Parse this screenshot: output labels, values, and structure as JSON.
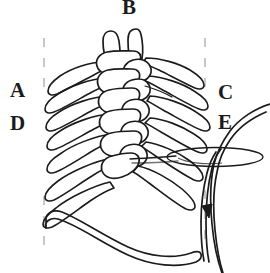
{
  "figure": {
    "type": "line-drawing",
    "background_color": "#ffffff",
    "ink_color": "#1b1b1b",
    "width": 270,
    "height": 273,
    "labels": [
      {
        "id": "A",
        "text": "A",
        "position": "left-upper"
      },
      {
        "id": "B",
        "text": "B",
        "position": "top-center"
      },
      {
        "id": "C",
        "text": "C",
        "position": "right-upper"
      },
      {
        "id": "D",
        "text": "D",
        "position": "left-middle"
      },
      {
        "id": "E",
        "text": "E",
        "position": "right-middle"
      }
    ],
    "elements": {
      "spine_label": "braided vertebral column",
      "ribs_left_label": "left rib series",
      "ribs_right_label": "right rib series",
      "tube_label": "catheter tube with arrow",
      "ring_label": "elliptical ring",
      "lower_arc_label": "lower costal arch",
      "frame_label": "dashed boundary frame"
    }
  }
}
